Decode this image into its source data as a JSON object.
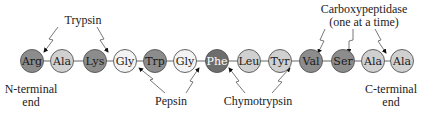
{
  "diagram": {
    "residues": [
      {
        "name": "Arg",
        "cx": 32,
        "fill": "#8c8c8c",
        "text": "#1a1a1a"
      },
      {
        "name": "Ala",
        "cx": 62,
        "fill": "#d0d0d0",
        "text": "#1a1a1a"
      },
      {
        "name": "Lys",
        "cx": 95,
        "fill": "#8c8c8c",
        "text": "#1a1a1a"
      },
      {
        "name": "Gly",
        "cx": 125,
        "fill": "#f3f3f3",
        "text": "#1a1a1a"
      },
      {
        "name": "Trp",
        "cx": 155,
        "fill": "#8c8c8c",
        "text": "#1a1a1a"
      },
      {
        "name": "Gly",
        "cx": 185,
        "fill": "#f3f3f3",
        "text": "#1a1a1a"
      },
      {
        "name": "Phe",
        "cx": 217,
        "fill": "#6d6d6d",
        "text": "#ffffff"
      },
      {
        "name": "Leu",
        "cx": 249,
        "fill": "#d0d0d0",
        "text": "#1a1a1a"
      },
      {
        "name": "Tyr",
        "cx": 280,
        "fill": "#d0d0d0",
        "text": "#1a1a1a"
      },
      {
        "name": "Val",
        "cx": 311,
        "fill": "#8c8c8c",
        "text": "#1a1a1a"
      },
      {
        "name": "Ser",
        "cx": 343,
        "fill": "#8c8c8c",
        "text": "#1a1a1a"
      },
      {
        "name": "Ala",
        "cx": 373,
        "fill": "#d0d0d0",
        "text": "#1a1a1a"
      },
      {
        "name": "Ala",
        "cx": 402,
        "fill": "#d0d0d0",
        "text": "#1a1a1a"
      }
    ],
    "labels": {
      "trypsin": "Trypsin",
      "pepsin": "Pepsin",
      "chymotrypsin": "Chymotrypsin",
      "carboxypeptidase_line1": "Carboxypeptidase",
      "carboxypeptidase_line2": "(one at a time)",
      "n_terminal_line1": "N-terminal",
      "n_terminal_line2": "end",
      "c_terminal_line1": "C-terminal",
      "c_terminal_line2": "end"
    }
  }
}
